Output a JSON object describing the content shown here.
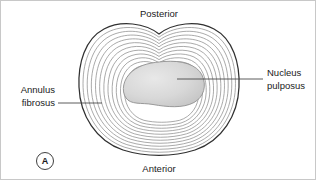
{
  "figure": {
    "panel_letter": "A",
    "labels": {
      "posterior": "Posterior",
      "anterior": "Anterior",
      "annulus_line1": "Annulus",
      "annulus_line2": "fibrosus",
      "nucleus_line1": "Nucleus",
      "nucleus_line2": "pulposus"
    },
    "colors": {
      "outline": "#303030",
      "lamella": "#8e8e8e",
      "nucleus_fill_light": "#e2e2e2",
      "nucleus_fill_dark": "#c4c4c4",
      "nucleus_stroke": "#909090",
      "leader": "#4a4a4a",
      "text": "#1a1a1a",
      "background": "#ffffff",
      "border": "#c8c8c8"
    },
    "geometry": {
      "lamella_count": 11,
      "disc_left": 78,
      "disc_right": 238,
      "disc_top": 22,
      "disc_bottom": 152,
      "nucleus_left": 123,
      "nucleus_right": 203,
      "nucleus_top": 60,
      "nucleus_bottom": 105
    }
  }
}
